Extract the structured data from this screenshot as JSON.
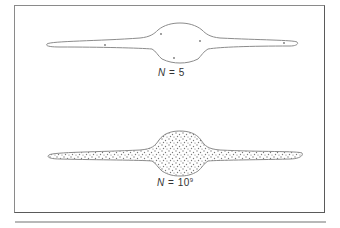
{
  "figure": {
    "panels": [
      {
        "id": "top",
        "label": {
          "variable": "N",
          "equals": "=",
          "value": "5",
          "exponent": ""
        },
        "shape": "edge-on disk galaxy outline with central bulge",
        "fill": "sparse points",
        "point_count_shown": 5
      },
      {
        "id": "bottom",
        "label": {
          "variable": "N",
          "equals": "=",
          "value": "10",
          "exponent": "9"
        },
        "shape": "edge-on disk galaxy outline with central bulge",
        "fill": "dense stippled points"
      }
    ],
    "colors": {
      "outline": "#8c8c8c",
      "frame": "#5a5a5a",
      "stipple": "#7a7a7a",
      "separator": "#b8b8b8"
    }
  }
}
